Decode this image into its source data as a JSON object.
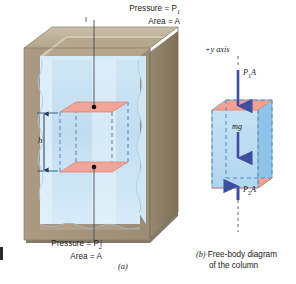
{
  "figure": {
    "domain": "physics-pressure-depth-diagram",
    "panel_a": {
      "caption": "(a)",
      "top_label_line1": "Pressure = P",
      "top_label_sub1": "1",
      "top_label_line2": "Area = A",
      "bottom_label_line1": "Pressure = P",
      "bottom_label_sub1": "2",
      "bottom_label_line2": "Area = A",
      "height_label": "h",
      "container": "open rectangular tank with thick tan walls",
      "fluid": "light blue liquid",
      "column": "imaginary fluid column with pink top and bottom faces"
    },
    "panel_b": {
      "caption_marker": "(b)",
      "caption_line1": "Free-body diagram",
      "caption_line2": "of the column",
      "axis_label": "+y axis",
      "force_top": "P",
      "force_top_sub": "1",
      "force_top_suffix": "A",
      "force_weight": "mg",
      "force_bottom": "P",
      "force_bottom_sub": "2",
      "force_bottom_suffix": "A"
    },
    "colors": {
      "wall_front": "#a79781",
      "wall_side": "#8f8068",
      "wall_rim": "#c5b9a4",
      "water": "#bfdcf0",
      "water_light": "#d9ecf8",
      "face_pink": "#f2a896",
      "box_front": "#bcdcf2",
      "box_side": "#93c4e8",
      "arrow_blue": "#3f4e9e",
      "dash_blue": "#5f8fc0",
      "text": "#1a1a1a"
    }
  }
}
